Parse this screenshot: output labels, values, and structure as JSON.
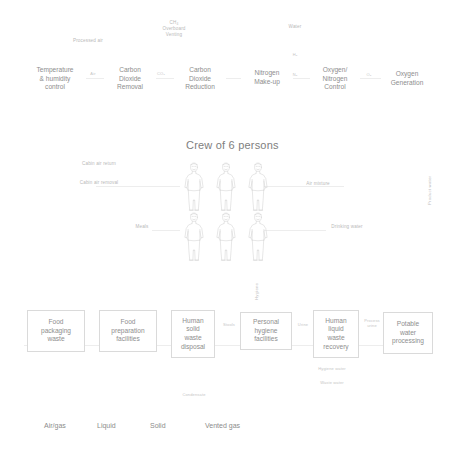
{
  "diagram": {
    "crew_title": "Crew of 6 persons",
    "crew_count": 6,
    "colors": {
      "background": "#ffffff",
      "box_border": "#dadada",
      "box_text": "#8e8e8e",
      "flow_label": "#b9b9b9",
      "title_text": "#7e7e7e",
      "wire": "#ededed"
    }
  },
  "air_loop": {
    "boxes": [
      {
        "id": "temperature-humidity-control",
        "label": "Temperature\n& humidity\ncontrol"
      },
      {
        "id": "carbon-dioxide-removal",
        "label": "Carbon\nDioxide\nRemoval"
      },
      {
        "id": "carbon-dioxide-reduction",
        "label": "Carbon\nDioxide\nReduction"
      },
      {
        "id": "nitrogen-make-up",
        "label": "Nitrogen\nMake-up"
      },
      {
        "id": "oxygen-nitrogen-control",
        "label": "Oxygen/\nNitrogen\nControl"
      },
      {
        "id": "oxygen-generation",
        "label": "Oxygen\nGeneration"
      }
    ],
    "flow_labels": [
      {
        "id": "processed-air",
        "text": "Processed air"
      },
      {
        "id": "ch4-overboard-venting",
        "text": "CH₄\nOverboard\nVenting"
      },
      {
        "id": "water-top",
        "text": "Water"
      },
      {
        "id": "air",
        "text": "Air"
      },
      {
        "id": "co2",
        "text": "CO₂"
      },
      {
        "id": "h2",
        "text": "H₂"
      },
      {
        "id": "n2",
        "text": "N₂"
      },
      {
        "id": "o2",
        "text": "O₂"
      }
    ]
  },
  "crew_loop": {
    "flow_labels": [
      {
        "id": "cabin-air-return",
        "text": "Cabin air return"
      },
      {
        "id": "cabin-air-removal",
        "text": "Cabin air removal"
      },
      {
        "id": "meals",
        "text": "Meals"
      },
      {
        "id": "air-mixture",
        "text": "Air mixture"
      },
      {
        "id": "drinking-water",
        "text": "Drinking water"
      },
      {
        "id": "hygiene",
        "text": "Hygiene"
      },
      {
        "id": "product-water",
        "text": "Product water"
      }
    ]
  },
  "waste_loop": {
    "boxes": [
      {
        "id": "food-packaging-waste",
        "label": "Food\npackaging\nwaste"
      },
      {
        "id": "food-preparation-facilities",
        "label": "Food\npreparation\nfacilities"
      },
      {
        "id": "human-solid-waste-disposal",
        "label": "Human\nsolid\nwaste\ndisposal"
      },
      {
        "id": "personal-hygiene-facilities",
        "label": "Personal\nhygiene\nfacilities"
      },
      {
        "id": "human-liquid-waste-recovery",
        "label": "Human\nliquid\nwaste\nrecovery"
      },
      {
        "id": "potable-water-processing",
        "label": "Potable\nwater\nprocessing"
      }
    ],
    "flow_labels": [
      {
        "id": "stools",
        "text": "Stools"
      },
      {
        "id": "urine",
        "text": "Urine"
      },
      {
        "id": "process-urine",
        "text": "Process\nurine"
      },
      {
        "id": "hygiene-water",
        "text": "Hygiene water"
      },
      {
        "id": "waste-water",
        "text": "Waste water"
      },
      {
        "id": "condensate",
        "text": "Condensate"
      }
    ]
  },
  "legend": {
    "items": [
      {
        "id": "air-gas",
        "label": "Air/gas"
      },
      {
        "id": "liquid",
        "label": "Liquid"
      },
      {
        "id": "solid",
        "label": "Solid"
      },
      {
        "id": "vented-gas",
        "label": "Vented gas"
      }
    ]
  }
}
